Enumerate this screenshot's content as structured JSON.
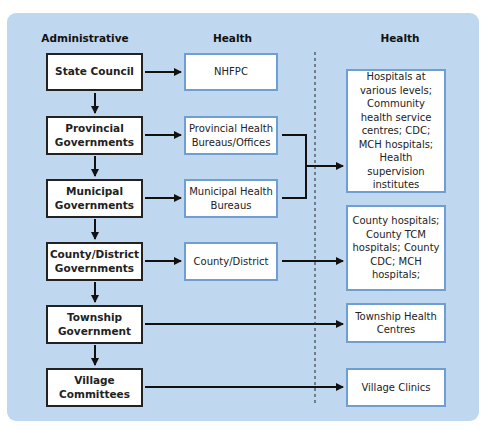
{
  "headers": {
    "administrative": "Administrative",
    "health_mid": "Health",
    "health_right": "Health"
  },
  "admin_levels": [
    {
      "label": "State Council"
    },
    {
      "label": "Provincial Governments"
    },
    {
      "label": "Municipal Governments"
    },
    {
      "label": "County/District Governments"
    },
    {
      "label": "Township Government"
    },
    {
      "label": "Village Committees"
    }
  ],
  "health_admin": [
    {
      "label": "NHFPC"
    },
    {
      "label": "Provincial Health Bureaus/Offices"
    },
    {
      "label": "Municipal Health Bureaus"
    },
    {
      "label": "County/District"
    }
  ],
  "health_services": [
    {
      "label": "Hospitals at various levels; Community health service centres; CDC; MCH hospitals; Health supervision institutes"
    },
    {
      "label": "County hospitals; County TCM hospitals; County CDC; MCH hospitals;"
    },
    {
      "label": "Township Health Centres"
    },
    {
      "label": "Village Clinics"
    }
  ],
  "colors": {
    "panel_bg": "#c0d8ef",
    "admin_border": "#222222",
    "health_border": "#6f9fd2",
    "arrow": "#111111"
  }
}
